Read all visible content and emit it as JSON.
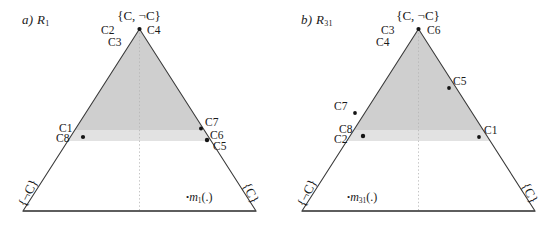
{
  "figure": {
    "background": "#ffffff",
    "line_color": "#3a3a3a",
    "shade_upper": "#cfcfcf",
    "shade_lower": "#e2e2e2",
    "point_color": "#151515"
  },
  "panels": [
    {
      "id": "a",
      "label_prefix": "a)",
      "label_symbol": "R",
      "label_sub": "1",
      "apex_label": "{C, ¬C}",
      "corner_left_label": "{¬C}",
      "corner_right_label": "{C}",
      "mass_label_symbol": "m",
      "mass_label_sub": "1",
      "mass_label_suffix": "(.)",
      "mass_label_bullet": "•",
      "apex_left_labels": [
        "C2",
        "C3"
      ],
      "apex_right_labels": [
        "C4"
      ],
      "left_edge_labels": [
        "C1",
        "C8"
      ],
      "right_edge_labels": [
        "C7",
        "C6",
        "C5"
      ],
      "points": [
        {
          "name": "apex",
          "x": 139.5,
          "y": 29
        },
        {
          "name": "c1-c8",
          "x": 83,
          "y": 137
        },
        {
          "name": "c7",
          "x": 201,
          "y": 128
        },
        {
          "name": "c6-c5",
          "x": 207,
          "y": 140
        }
      ],
      "shade_upper_bottom_y": 130,
      "shade_lower_bottom_y": 141
    },
    {
      "id": "b",
      "label_prefix": "b)",
      "label_symbol": "R",
      "label_sub": "31",
      "apex_label": "{C, ¬C}",
      "corner_left_label": "{¬C}",
      "corner_right_label": "{C}",
      "mass_label_symbol": "m",
      "mass_label_sub": "31",
      "mass_label_suffix": "(.)",
      "mass_label_bullet": "•",
      "apex_left_labels": [
        "C3",
        "C4"
      ],
      "apex_right_labels": [
        "C6"
      ],
      "left_edge_labels": [
        "C7",
        "C8",
        "C2"
      ],
      "right_edge_labels": [
        "C5",
        "C1"
      ],
      "points": [
        {
          "name": "apex",
          "x": 139.5,
          "y": 29
        },
        {
          "name": "c7",
          "x": 76,
          "y": 113
        },
        {
          "name": "c8-c2",
          "x": 84,
          "y": 136
        },
        {
          "name": "c5",
          "x": 170,
          "y": 88
        },
        {
          "name": "c1",
          "x": 200,
          "y": 137
        }
      ],
      "shade_upper_bottom_y": 130,
      "shade_lower_bottom_y": 141
    }
  ]
}
